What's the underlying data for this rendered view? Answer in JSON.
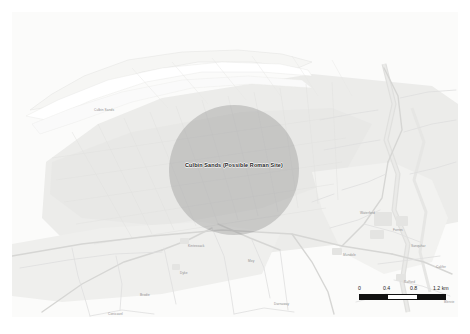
{
  "map": {
    "site_marker": {
      "label": "Culbin Sands (Possible Roman Site)",
      "fill_color": "#787878",
      "shape": "circle"
    },
    "background_color": "#f7f7f5",
    "place_labels": [
      {
        "text": "Culbin Sands",
        "x": 82,
        "y": 96
      },
      {
        "text": "Kintessack",
        "x": 176,
        "y": 232
      },
      {
        "text": "Dyke",
        "x": 168,
        "y": 259
      },
      {
        "text": "Brodie",
        "x": 128,
        "y": 281
      },
      {
        "text": "Moy",
        "x": 236,
        "y": 247
      },
      {
        "text": "Forres",
        "x": 381,
        "y": 216
      },
      {
        "text": "Rafford",
        "x": 392,
        "y": 268
      },
      {
        "text": "Waterford",
        "x": 348,
        "y": 199
      },
      {
        "text": "Califer",
        "x": 424,
        "y": 253
      },
      {
        "text": "Mundole",
        "x": 331,
        "y": 241
      },
      {
        "text": "Sanquhar",
        "x": 399,
        "y": 232
      },
      {
        "text": "Blervie",
        "x": 432,
        "y": 288
      },
      {
        "text": "Conicavel",
        "x": 96,
        "y": 300
      },
      {
        "text": "Darnaway",
        "x": 262,
        "y": 290
      }
    ],
    "scale_bar": {
      "unit": "km",
      "ticks": [
        "0",
        "0.4",
        "0.8",
        "1.2 km"
      ],
      "segment_count": 3,
      "segment_colors": [
        "#111111",
        "#ffffff",
        "#111111"
      ]
    }
  }
}
